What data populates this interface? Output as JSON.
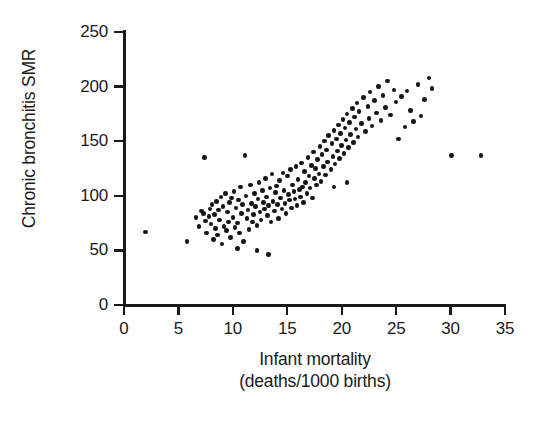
{
  "chart_data": {
    "type": "scatter",
    "title": "",
    "xlabel": "Infant mortality (deaths/1000 births)",
    "xlabel_line1": "Infant mortality",
    "xlabel_line2": "(deaths/1000 births)",
    "ylabel": "Chronic bronchitis SMR",
    "xlim": [
      0,
      35
    ],
    "ylim": [
      0,
      250
    ],
    "xticks": [
      0,
      5,
      10,
      15,
      20,
      25,
      30,
      35
    ],
    "yticks": [
      0,
      50,
      100,
      150,
      200,
      250
    ],
    "grid": false,
    "legend": null,
    "marker": {
      "shape": "circle",
      "color": "#161616",
      "size_px": 4.6
    },
    "n_points": 181,
    "x": [
      2.0,
      7.4,
      11.1,
      5.8,
      6.6,
      6.9,
      7.1,
      7.3,
      7.5,
      7.6,
      7.8,
      7.9,
      8.0,
      8.1,
      8.2,
      8.3,
      8.4,
      8.5,
      8.6,
      8.7,
      8.8,
      8.9,
      9.0,
      9.1,
      9.2,
      9.3,
      9.4,
      9.5,
      9.6,
      9.7,
      9.8,
      9.9,
      10.0,
      10.1,
      10.2,
      10.3,
      10.4,
      10.5,
      10.6,
      10.7,
      10.8,
      10.9,
      11.0,
      11.2,
      11.3,
      11.4,
      11.5,
      11.6,
      11.7,
      11.8,
      11.9,
      12.0,
      12.1,
      12.2,
      12.3,
      12.4,
      12.5,
      12.6,
      12.7,
      12.8,
      12.9,
      13.0,
      13.1,
      13.2,
      13.3,
      13.4,
      13.5,
      13.6,
      13.7,
      13.8,
      13.9,
      14.0,
      14.1,
      14.2,
      14.3,
      14.4,
      14.5,
      14.6,
      14.7,
      14.8,
      14.9,
      15.0,
      15.1,
      15.2,
      15.3,
      15.4,
      15.5,
      15.6,
      15.7,
      15.8,
      15.9,
      16.0,
      16.1,
      16.2,
      16.3,
      16.4,
      16.5,
      16.6,
      16.7,
      16.8,
      16.9,
      17.0,
      17.1,
      17.2,
      17.3,
      17.4,
      17.5,
      17.6,
      17.7,
      17.8,
      17.9,
      18.0,
      18.1,
      18.2,
      18.3,
      18.4,
      18.5,
      18.6,
      18.7,
      18.8,
      19.0,
      19.1,
      19.2,
      19.3,
      19.4,
      19.5,
      19.6,
      19.7,
      19.8,
      19.9,
      20.0,
      20.1,
      20.2,
      20.3,
      20.4,
      20.5,
      20.6,
      20.7,
      20.8,
      21.0,
      21.1,
      21.2,
      21.3,
      21.4,
      21.5,
      21.6,
      21.8,
      22.0,
      22.2,
      22.4,
      22.5,
      22.6,
      22.8,
      23.0,
      23.2,
      23.4,
      23.6,
      23.8,
      24.0,
      24.2,
      24.5,
      24.8,
      25.0,
      25.2,
      25.5,
      25.8,
      26.0,
      26.3,
      26.6,
      27.0,
      27.3,
      27.6,
      28.0,
      28.3,
      20.5,
      19.3,
      12.2,
      13.3,
      10.4,
      30.1,
      32.8
    ],
    "y": [
      67,
      135,
      137,
      58,
      80,
      72,
      86,
      84,
      77,
      66,
      81,
      88,
      74,
      92,
      60,
      83,
      70,
      95,
      64,
      87,
      78,
      99,
      56,
      90,
      72,
      102,
      68,
      85,
      76,
      94,
      62,
      98,
      80,
      104,
      71,
      89,
      75,
      96,
      66,
      108,
      84,
      92,
      58,
      100,
      79,
      87,
      69,
      110,
      93,
      76,
      83,
      102,
      90,
      73,
      97,
      112,
      85,
      78,
      105,
      94,
      88,
      116,
      99,
      82,
      91,
      107,
      76,
      120,
      95,
      86,
      103,
      109,
      92,
      79,
      114,
      98,
      88,
      121,
      105,
      93,
      84,
      118,
      101,
      96,
      124,
      89,
      110,
      104,
      97,
      127,
      91,
      115,
      106,
      99,
      130,
      108,
      94,
      122,
      112,
      102,
      135,
      118,
      107,
      128,
      98,
      140,
      116,
      125,
      110,
      133,
      120,
      145,
      113,
      138,
      127,
      150,
      119,
      142,
      131,
      155,
      124,
      148,
      136,
      160,
      129,
      152,
      141,
      165,
      134,
      157,
      146,
      170,
      139,
      162,
      151,
      175,
      144,
      167,
      156,
      180,
      149,
      172,
      161,
      185,
      154,
      177,
      166,
      190,
      159,
      182,
      171,
      195,
      164,
      187,
      176,
      200,
      169,
      192,
      181,
      205,
      174,
      197,
      186,
      152,
      191,
      163,
      196,
      178,
      168,
      202,
      173,
      188,
      208,
      198,
      112,
      108,
      50,
      46,
      52,
      137,
      137
    ]
  }
}
